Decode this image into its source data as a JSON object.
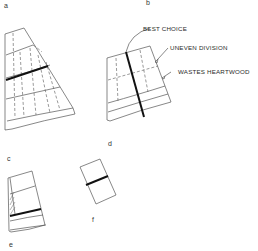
{
  "diagram": {
    "panels": [
      {
        "id": "a",
        "label": "a"
      },
      {
        "id": "b",
        "label": "b"
      },
      {
        "id": "c",
        "label": "c"
      },
      {
        "id": "d",
        "label": "d"
      },
      {
        "id": "e",
        "label": "e"
      },
      {
        "id": "f",
        "label": "f"
      }
    ],
    "annotations": {
      "best_choice": "BEST CHOICE",
      "uneven_division": "UNEVEN DIVISION",
      "wastes_heartwood": "WASTES HEARTWOOD"
    },
    "colors": {
      "line": "#555555",
      "cut_line": "#111111",
      "background": "#ffffff"
    }
  }
}
